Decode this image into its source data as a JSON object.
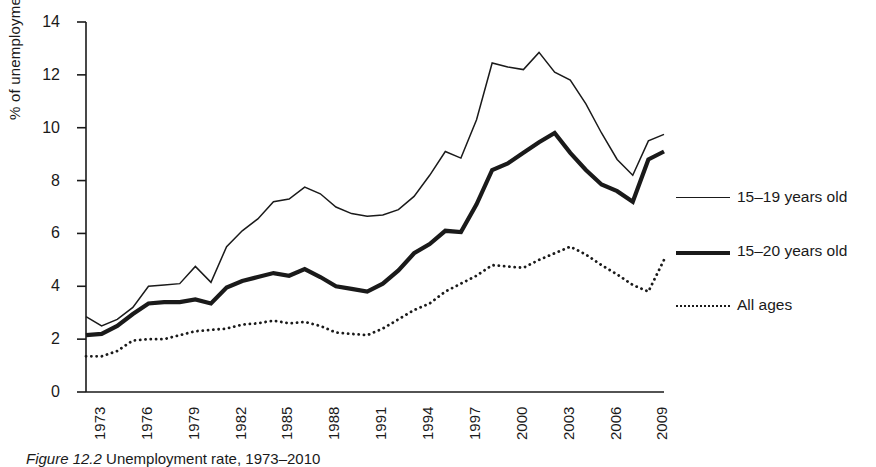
{
  "figure": {
    "caption_prefix": "Figure 12.2",
    "caption_rest": " Unemployment rate, 1973–2010"
  },
  "axes": {
    "ylabel": "% of unemployment",
    "yticks": [
      0,
      2,
      4,
      6,
      8,
      10,
      12,
      14
    ],
    "xticks": [
      "1973",
      "1976",
      "1979",
      "1982",
      "1985",
      "1988",
      "1991",
      "1994",
      "1997",
      "2000",
      "2003",
      "2006",
      "2009"
    ]
  },
  "legend": {
    "position": "right",
    "items": [
      {
        "label": "15–19 years old",
        "style": "thin-solid",
        "swatch": "sw-thin"
      },
      {
        "label": "15–20 years old",
        "style": "thick-solid",
        "swatch": "sw-thick"
      },
      {
        "label": "All ages",
        "style": "dotted",
        "swatch": "sw-dot"
      }
    ]
  },
  "colors": {
    "line": "#1a1a1a",
    "axis": "#1a1a1a",
    "background": "#ffffff"
  },
  "chart_data": {
    "type": "line",
    "title": "Unemployment rate, 1973–2010",
    "xlabel": "",
    "ylabel": "% of unemployment",
    "xlim": [
      1973,
      2010
    ],
    "ylim": [
      0,
      14
    ],
    "grid": false,
    "legend_position": "right",
    "x": [
      1973,
      1974,
      1975,
      1976,
      1977,
      1978,
      1979,
      1980,
      1981,
      1982,
      1983,
      1984,
      1985,
      1986,
      1987,
      1988,
      1989,
      1990,
      1991,
      1992,
      1993,
      1994,
      1995,
      1996,
      1997,
      1998,
      1999,
      2000,
      2001,
      2002,
      2003,
      2004,
      2005,
      2006,
      2007,
      2008,
      2009,
      2010
    ],
    "series": [
      {
        "name": "15–19 years old",
        "style": "thin-solid",
        "values": [
          2.85,
          2.5,
          2.75,
          3.2,
          4.0,
          4.05,
          4.1,
          4.75,
          4.15,
          5.5,
          6.1,
          6.55,
          7.2,
          7.3,
          7.75,
          7.5,
          7.0,
          6.75,
          6.65,
          6.7,
          6.9,
          7.4,
          8.2,
          9.1,
          8.85,
          10.3,
          12.45,
          12.3,
          12.2,
          12.85,
          12.1,
          11.8,
          10.9,
          9.8,
          8.8,
          8.2,
          9.5,
          9.75
        ]
      },
      {
        "name": "15–20 years old",
        "style": "thick-solid",
        "values": [
          2.15,
          2.2,
          2.5,
          2.95,
          3.35,
          3.4,
          3.4,
          3.5,
          3.35,
          3.95,
          4.2,
          4.35,
          4.5,
          4.4,
          4.65,
          4.35,
          4.0,
          3.9,
          3.8,
          4.1,
          4.6,
          5.25,
          5.6,
          6.1,
          6.05,
          7.1,
          8.4,
          8.65,
          9.05,
          9.45,
          9.8,
          9.05,
          8.4,
          7.85,
          7.6,
          7.2,
          8.8,
          9.1
        ]
      },
      {
        "name": "All ages",
        "style": "dotted",
        "values": [
          1.35,
          1.35,
          1.55,
          1.95,
          2.0,
          2.0,
          2.15,
          2.3,
          2.35,
          2.4,
          2.55,
          2.6,
          2.7,
          2.6,
          2.65,
          2.5,
          2.25,
          2.2,
          2.15,
          2.4,
          2.75,
          3.1,
          3.35,
          3.8,
          4.1,
          4.4,
          4.8,
          4.75,
          4.7,
          5.0,
          5.25,
          5.5,
          5.2,
          4.8,
          4.45,
          4.05,
          3.8,
          5.0
        ]
      }
    ]
  }
}
